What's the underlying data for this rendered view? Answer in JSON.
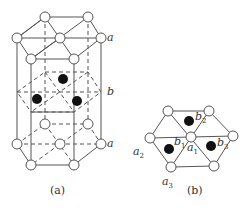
{
  "figure_a": {
    "caption": "(a)",
    "labels": {
      "top_layer": "a",
      "middle_layer": "b",
      "bottom_layer": "a"
    },
    "layers": [
      "a",
      "b",
      "a"
    ]
  },
  "figure_b": {
    "caption": "(b)",
    "labels": {
      "a1": {
        "base": "a",
        "sub": "1"
      },
      "a2": {
        "base": "a",
        "sub": "2"
      },
      "a3": {
        "base": "a",
        "sub": "3"
      },
      "b1": {
        "base": "b",
        "sub": "1"
      },
      "b2": {
        "base": "b",
        "sub": "2"
      },
      "b3": {
        "base": "b",
        "sub": "3"
      }
    }
  },
  "colors": {
    "line": "#555555",
    "atom_open_fill": "#ffffff",
    "atom_filled": "#111111"
  }
}
